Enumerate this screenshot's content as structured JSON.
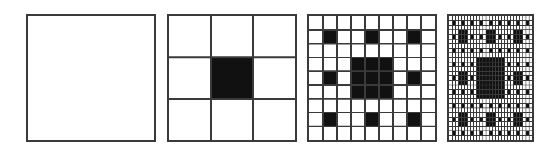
{
  "figure": {
    "width_px": 536,
    "height_px": 151,
    "background_color": "#ffffff",
    "line_color": "#3a3a3a",
    "fill_color": "#111111",
    "empty_color": "#ffffff"
  },
  "chart_data": {
    "type": "heatmap",
    "subtitle": "",
    "xlabel": "",
    "ylabel": "",
    "grid": true,
    "legend": "none",
    "annotations": [],
    "colormap": {
      "filled": "#111111",
      "empty": "#ffffff",
      "gridline": "#3a3a3a"
    },
    "construction_rule": "A cell at grid position (row, col) in the level-n grid of size 3^(n-1) is filled black if and only if at least one matching pair of base-3 digits of row and col both equal 1. Level 1 is a single empty square.",
    "panels": [
      {
        "index": 0,
        "label": "iteration 1",
        "grid_size": 1,
        "divisions": 1,
        "filled_cells": 0,
        "total_cells": 1,
        "filled_fraction": 0.0,
        "x_px": 26,
        "y_px": 14,
        "w_px": 130,
        "h_px": 128,
        "border_width_px": 2,
        "gridline_width_px": 2
      },
      {
        "index": 1,
        "label": "iteration 2",
        "grid_size": 3,
        "divisions": 3,
        "filled_cells": 1,
        "total_cells": 9,
        "filled_fraction": 0.1111,
        "filled_coordinates": [
          [
            1,
            1
          ]
        ],
        "x_px": 167,
        "y_px": 14,
        "w_px": 130,
        "h_px": 128,
        "border_width_px": 2,
        "gridline_width_px": 2
      },
      {
        "index": 2,
        "label": "iteration 3",
        "grid_size": 9,
        "divisions": 9,
        "filled_cells": 17,
        "total_cells": 81,
        "filled_fraction": 0.2099,
        "filled_coordinates": [
          [
            1,
            1
          ],
          [
            1,
            4
          ],
          [
            1,
            7
          ],
          [
            3,
            3
          ],
          [
            3,
            4
          ],
          [
            3,
            5
          ],
          [
            4,
            1
          ],
          [
            4,
            3
          ],
          [
            4,
            4
          ],
          [
            4,
            5
          ],
          [
            4,
            7
          ],
          [
            5,
            3
          ],
          [
            5,
            4
          ],
          [
            5,
            5
          ],
          [
            7,
            1
          ],
          [
            7,
            4
          ],
          [
            7,
            7
          ]
        ],
        "x_px": 307,
        "y_px": 14,
        "w_px": 130,
        "h_px": 128,
        "border_width_px": 2,
        "gridline_width_px": 1.6
      },
      {
        "index": 3,
        "label": "iteration 4",
        "grid_size": 27,
        "divisions": 27,
        "filled_cells": 289,
        "total_cells": 729,
        "filled_fraction": 0.3964,
        "x_px": 447,
        "y_px": 14,
        "w_px": 87,
        "h_px": 128,
        "border_width_px": 2,
        "gridline_width_px": 0.9
      }
    ],
    "series": [
      {
        "name": "filled cell count",
        "x": [
          1,
          2,
          3,
          4
        ],
        "values": [
          0,
          1,
          17,
          289
        ]
      },
      {
        "name": "grid size (cells per side)",
        "x": [
          1,
          2,
          3,
          4
        ],
        "values": [
          1,
          3,
          9,
          27
        ]
      },
      {
        "name": "filled fraction",
        "x": [
          1,
          2,
          3,
          4
        ],
        "values": [
          0.0,
          0.1111,
          0.2099,
          0.3964
        ]
      }
    ]
  }
}
